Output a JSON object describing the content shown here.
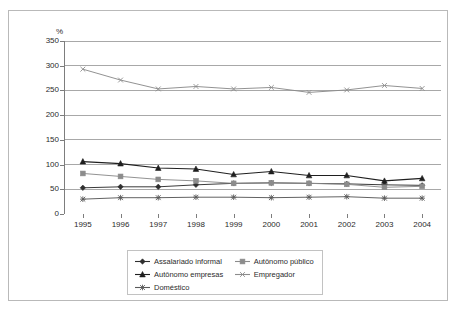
{
  "figure": {
    "y_axis_unit": "%",
    "frame_border_color": "#b9b9b9"
  },
  "chart_data": {
    "type": "line",
    "title": "",
    "subtitle": "",
    "xlabel": "",
    "ylabel": "%",
    "categories": [
      "1995",
      "1996",
      "1997",
      "1998",
      "1999",
      "2000",
      "2001",
      "2002",
      "2003",
      "2004"
    ],
    "x": [
      1995,
      1996,
      1997,
      1998,
      1999,
      2000,
      2001,
      2002,
      2003,
      2004
    ],
    "ylim": [
      0,
      350
    ],
    "yticks": [
      0,
      50,
      100,
      150,
      200,
      250,
      300,
      350
    ],
    "ytick_labels": [
      "0",
      "50",
      "100",
      "150",
      "200",
      "250",
      "300",
      "350"
    ],
    "grid": "horizontal",
    "legend_position": "bottom-center",
    "series": [
      {
        "name": "Assalariado informal",
        "marker": "diamond",
        "color": "#2f2f2f",
        "values": [
          53,
          55,
          55,
          59,
          62,
          63,
          62,
          61,
          59,
          58
        ]
      },
      {
        "name": "Autônomo público",
        "marker": "square",
        "color": "#8c8c8c",
        "values": [
          82,
          76,
          70,
          67,
          62,
          63,
          62,
          60,
          54,
          56
        ]
      },
      {
        "name": "Autônomo empresas",
        "marker": "triangle",
        "color": "#1f1f1f",
        "values": [
          106,
          102,
          93,
          91,
          80,
          86,
          78,
          78,
          67,
          72
        ]
      },
      {
        "name": "Empregador",
        "marker": "cross",
        "color": "#8c8c8c",
        "values": [
          293,
          271,
          253,
          258,
          253,
          256,
          246,
          251,
          260,
          254
        ]
      },
      {
        "name": "Doméstico",
        "marker": "asterisk",
        "color": "#5a5a5a",
        "values": [
          30,
          33,
          33,
          34,
          34,
          33,
          34,
          35,
          32,
          32
        ]
      }
    ]
  },
  "legend": {
    "rows": [
      [
        {
          "label": "Assalariado informal",
          "series": 0
        },
        {
          "label": "Autônomo público",
          "series": 1
        }
      ],
      [
        {
          "label": "Autônomo empresas",
          "series": 2
        },
        {
          "label": "Empregador",
          "series": 3
        }
      ],
      [
        {
          "label": "Doméstico",
          "series": 4
        }
      ]
    ]
  }
}
